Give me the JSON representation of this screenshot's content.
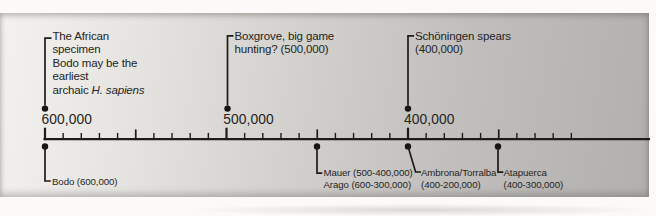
{
  "timeline": {
    "axis": {
      "major_ticks": [
        {
          "value": 600000,
          "label": "600,000"
        },
        {
          "value": 500000,
          "label": "500,000"
        },
        {
          "value": 400000,
          "label": "400,000"
        }
      ],
      "minor_tick_step": 10000,
      "medium_tick_values": [
        550000,
        450000,
        350000
      ],
      "first_tick_value": 600000,
      "last_tick_value": 310000,
      "direction": "years ago, decreasing left to right"
    },
    "events_above": [
      {
        "value": 600000,
        "lines": [
          "The African",
          "specimen",
          "Bodo may be the",
          "earliest"
        ],
        "last_line": {
          "normal": "archaic ",
          "italic": "H. sapiens"
        }
      },
      {
        "value": 500000,
        "lines": [
          "Boxgrove, big game",
          "hunting? (500,000)"
        ]
      },
      {
        "value": 400000,
        "lines": [
          "Schöningen spears",
          "(400,000)"
        ]
      }
    ],
    "events_below": [
      {
        "value": 600000,
        "lines": [
          "Bodo (600,000)"
        ]
      },
      {
        "value": 450000,
        "lines": [
          "Mauer (500-400,000)",
          "Arago (600-300,000)"
        ]
      },
      {
        "value": 400000,
        "lines": [
          "Ambrona/Torralba",
          "(400-200,000)"
        ]
      },
      {
        "value": 350000,
        "lines": [
          "Atapuerca",
          "(400-300,000)"
        ]
      }
    ],
    "colors": {
      "ink": "#1d1c1a",
      "text": "#262422",
      "panel_light": "#f3f2ef",
      "panel_dark": "#b1b0ae"
    }
  }
}
